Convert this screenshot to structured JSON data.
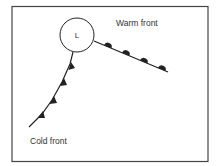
{
  "diagram": {
    "low_pressure": {
      "label": "L"
    },
    "warm_front": {
      "label": "Warm front",
      "symbol": "semicircles"
    },
    "cold_front": {
      "label": "Cold front",
      "symbol": "triangles"
    },
    "colors": {
      "ink": "#222222",
      "frame": "#444444",
      "background": "#ffffff"
    }
  }
}
